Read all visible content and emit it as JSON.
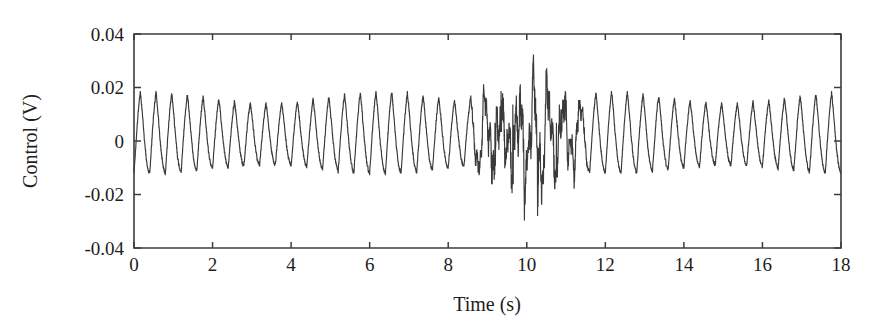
{
  "chart_data": {
    "type": "line",
    "title": "",
    "xlabel": "Time (s)",
    "ylabel": "Control (V)",
    "xlim": [
      0,
      18
    ],
    "ylim": [
      -0.04,
      0.04
    ],
    "xticks": [
      0,
      2,
      4,
      6,
      8,
      10,
      12,
      14,
      16,
      18
    ],
    "xtick_labels": [
      "0",
      "2",
      "4",
      "6",
      "8",
      "10",
      "12",
      "14",
      "16",
      "18"
    ],
    "yticks": [
      -0.04,
      -0.02,
      0,
      0.02,
      0.04
    ],
    "ytick_labels": [
      "-0.04",
      "-0.02",
      "0",
      "0.02",
      "0.04"
    ],
    "grid": false,
    "legend": null,
    "line_color": "#3a3a3a",
    "background_color": "#ffffff",
    "series": [
      {
        "name": "Control voltage",
        "description": "Periodic sawtooth-like control signal of roughly 2.5 Hz with a transient high-amplitude burst between about 8.8 s and 11.3 s",
        "base_frequency_hz": 2.5,
        "steady_peak": 0.015,
        "steady_trough": -0.013,
        "burst_window": [
          8.8,
          11.3
        ],
        "burst_max": 0.023,
        "burst_min": -0.033,
        "sample_rate_hz": 200,
        "n_cycles_visible": 45
      }
    ]
  },
  "axes": {
    "x_axis_name": "time-axis",
    "y_axis_name": "control-axis"
  }
}
